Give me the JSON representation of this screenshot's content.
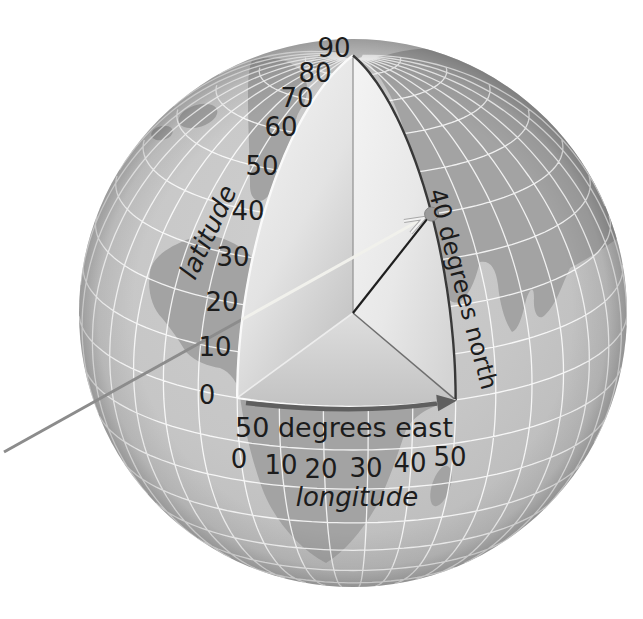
{
  "figure": {
    "latitude_scale": {
      "label": "latitude",
      "ticks": [
        "90",
        "80",
        "70",
        "60",
        "50",
        "40",
        "30",
        "20",
        "10",
        "0"
      ]
    },
    "longitude_scale": {
      "label": "longitude",
      "ticks": [
        "0",
        "10",
        "20",
        "30",
        "40",
        "50"
      ]
    },
    "annotations": {
      "longitude_arrow_label": "50 degrees east",
      "latitude_arc_label": "40 degrees north"
    },
    "marked_point": {
      "latitude_deg": 40,
      "longitude_deg": 50
    },
    "wedge": {
      "latitude_span_deg": 90,
      "longitude_span_deg": 50
    },
    "colors": {
      "background": "#ffffff",
      "ocean_center": "#cecece",
      "ocean_mid": "#c6c6c6",
      "ocean_edge": "#b6b6b6",
      "land": "#a3a3a3",
      "graticule": "#ffffff",
      "wedge_face_light": "#f7f7f7",
      "wedge_face_mid": "#e3e3e3",
      "wedge_face_dark": "#c6c6c6",
      "cut_edge_dark": "#383838",
      "cut_edge_light": "#fafafa",
      "axis_line": "#9c9c9c",
      "radius_line": "#1f1f1f",
      "equator_arrow": "#5f5f5f",
      "ray_outer": "#8c8c8c",
      "ray_inner": "#f1f1ec",
      "point_dot": "#9b9b9b",
      "text": "#1c1c1c"
    }
  }
}
